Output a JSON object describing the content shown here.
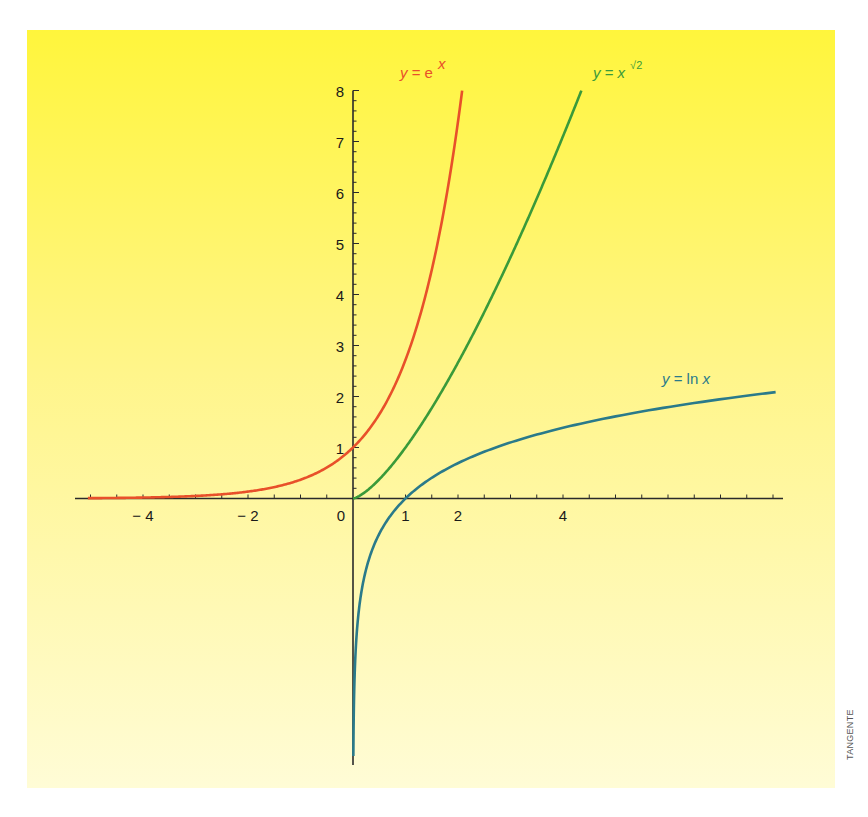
{
  "chart_data": {
    "type": "line",
    "title": "",
    "xlabel": "",
    "ylabel": "",
    "xlim": [
      -5.3,
      8.2
    ],
    "ylim": [
      -5.1,
      8
    ],
    "grid": false,
    "legend_position": "inline-labels",
    "x_tick_labels": [
      "−4",
      "−2",
      "0",
      "1",
      "2",
      "4"
    ],
    "x_tick_values": [
      -4,
      -2,
      0,
      1,
      2,
      4
    ],
    "y_tick_labels": [
      "1",
      "2",
      "3",
      "4",
      "5",
      "6",
      "7",
      "8"
    ],
    "y_tick_values": [
      1,
      2,
      3,
      4,
      5,
      6,
      7,
      8
    ],
    "series": [
      {
        "name": "y = e^x",
        "label_main": "y = e",
        "label_sup": "x",
        "color": "#E8502A",
        "domain": [
          -5.05,
          2.079
        ],
        "points": [
          [
            -5,
            0.007
          ],
          [
            -4,
            0.018
          ],
          [
            -3,
            0.05
          ],
          [
            -2,
            0.135
          ],
          [
            -1,
            0.368
          ],
          [
            0,
            1
          ],
          [
            0.5,
            1.65
          ],
          [
            1,
            2.72
          ],
          [
            1.5,
            4.48
          ],
          [
            2,
            7.39
          ],
          [
            2.079,
            8
          ]
        ]
      },
      {
        "name": "y = x^√2",
        "label_main": "y = x",
        "label_sup": "√2",
        "color": "#3A9A3A",
        "domain": [
          0,
          4.35
        ],
        "points": [
          [
            0,
            0
          ],
          [
            0.5,
            0.375
          ],
          [
            1,
            1
          ],
          [
            1.5,
            1.77
          ],
          [
            2,
            2.67
          ],
          [
            2.5,
            3.65
          ],
          [
            3,
            4.73
          ],
          [
            3.5,
            5.88
          ],
          [
            4,
            7.1
          ],
          [
            4.35,
            8
          ]
        ]
      },
      {
        "name": "y = ln x",
        "label_main": "y = ln x",
        "label_sup": "",
        "color": "#2A7A8A",
        "domain": [
          0.0064,
          8.05
        ],
        "points": [
          [
            0.0064,
            -5.05
          ],
          [
            0.02,
            -3.91
          ],
          [
            0.05,
            -3.0
          ],
          [
            0.1,
            -2.3
          ],
          [
            0.25,
            -1.39
          ],
          [
            0.5,
            -0.69
          ],
          [
            1,
            0
          ],
          [
            2,
            0.69
          ],
          [
            3,
            1.1
          ],
          [
            4,
            1.39
          ],
          [
            5,
            1.61
          ],
          [
            6,
            1.79
          ],
          [
            7,
            1.95
          ],
          [
            8,
            2.08
          ]
        ]
      }
    ]
  },
  "credit": "TANGENTE",
  "colors": {
    "background_top": "#FFF53C",
    "background_bottom": "#FFFCD6",
    "axis": "#2a2a2a",
    "tick_label": "#1a1a1a"
  }
}
